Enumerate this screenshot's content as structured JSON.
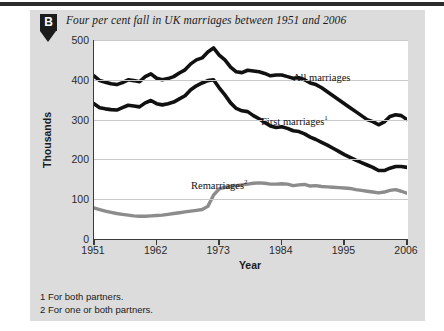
{
  "badge": {
    "letter": "B"
  },
  "title": "Four per cent fall in UK marriages between 1951 and 2006",
  "axis": {
    "y_title": "Thousands",
    "x_title": "Year"
  },
  "footnotes": [
    "1 For both partners.",
    "2 For one or both partners."
  ],
  "labels": {
    "all": "All marriages",
    "first": "First marriages",
    "first_sup": "1",
    "remarriages": "Remarriages",
    "remarriages_sup": "2"
  },
  "colors": {
    "panel": "#dcdcdc",
    "plot_background": "#ffffff",
    "axis": "#3a3a3a",
    "gridline": "#c9c9c9",
    "all_marriages": "#111111",
    "first_marriages": "#111111",
    "remarriages": "#8c8c8c",
    "badge": "#1c1c1c",
    "top_rule": "#2b2b2b"
  },
  "chart_data": {
    "type": "line",
    "title": "Four per cent fall in UK marriages between 1951 and 2006",
    "xlabel": "Year",
    "ylabel": "Thousands",
    "xlim": [
      1951,
      2006
    ],
    "ylim": [
      0,
      500
    ],
    "yticks": [
      0,
      100,
      200,
      300,
      400,
      500
    ],
    "xticks": [
      1951,
      1962,
      1973,
      1984,
      1995,
      2006
    ],
    "grid": true,
    "legend": "inline-annotations",
    "x": [
      1951,
      1952,
      1953,
      1954,
      1955,
      1956,
      1957,
      1958,
      1959,
      1960,
      1961,
      1962,
      1963,
      1964,
      1965,
      1966,
      1967,
      1968,
      1969,
      1970,
      1971,
      1972,
      1973,
      1974,
      1975,
      1976,
      1977,
      1978,
      1979,
      1980,
      1981,
      1982,
      1983,
      1984,
      1985,
      1986,
      1987,
      1988,
      1989,
      1990,
      1991,
      1992,
      1993,
      1994,
      1995,
      1996,
      1997,
      1998,
      1999,
      2000,
      2001,
      2002,
      2003,
      2004,
      2005,
      2006
    ],
    "series": [
      {
        "name": "All marriages",
        "color": "#111111",
        "values": [
          410,
          398,
          394,
          390,
          388,
          393,
          400,
          398,
          395,
          408,
          415,
          404,
          400,
          403,
          408,
          417,
          425,
          440,
          450,
          455,
          470,
          480,
          462,
          450,
          432,
          420,
          418,
          424,
          422,
          420,
          416,
          410,
          412,
          412,
          408,
          404,
          405,
          400,
          392,
          388,
          380,
          370,
          360,
          350,
          340,
          330,
          320,
          310,
          300,
          295,
          287,
          294,
          308,
          312,
          310,
          300
        ]
      },
      {
        "name": "First marriages",
        "color": "#111111",
        "footnote": "1",
        "values": [
          340,
          330,
          327,
          325,
          324,
          330,
          336,
          334,
          332,
          342,
          348,
          340,
          337,
          340,
          344,
          352,
          360,
          375,
          385,
          392,
          398,
          400,
          380,
          362,
          342,
          328,
          322,
          320,
          310,
          302,
          293,
          284,
          280,
          282,
          278,
          272,
          270,
          264,
          256,
          250,
          243,
          236,
          228,
          220,
          212,
          205,
          198,
          192,
          186,
          180,
          172,
          172,
          178,
          182,
          182,
          180
        ]
      },
      {
        "name": "Remarriages",
        "color": "#8c8c8c",
        "footnote": "2",
        "values": [
          78,
          74,
          70,
          67,
          64,
          62,
          60,
          58,
          57,
          57,
          58,
          59,
          60,
          62,
          64,
          66,
          68,
          70,
          72,
          74,
          82,
          110,
          126,
          130,
          132,
          134,
          136,
          138,
          140,
          141,
          140,
          138,
          138,
          139,
          138,
          134,
          136,
          137,
          133,
          134,
          132,
          131,
          130,
          129,
          128,
          127,
          124,
          122,
          120,
          118,
          116,
          118,
          122,
          124,
          120,
          115
        ]
      }
    ]
  }
}
